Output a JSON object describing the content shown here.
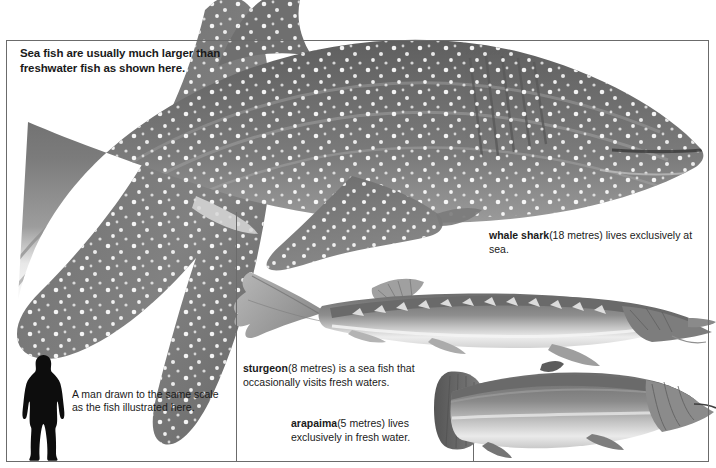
{
  "figure": {
    "headline": "Sea fish are usually much larger than freshwater fish as shown here.",
    "background_color": "#ffffff",
    "frame_color": "#6b6b6b",
    "text_color": "#1a1a1a"
  },
  "captions": {
    "whale_shark": {
      "name": "whale shark",
      "size": "(18 metres)",
      "rest": " lives exclusively at sea."
    },
    "sturgeon": {
      "name": "sturgeon",
      "size": "(8 metres)",
      "rest": " is a sea fish that occasionally visits fresh waters."
    },
    "arapaima": {
      "name": "arapaima",
      "size": "(5 metres)",
      "rest": " lives exclusively in fresh water."
    },
    "man": {
      "text": "A man drawn to the same scale as the fish illustrated here."
    }
  },
  "specimens": [
    {
      "id": "whale-shark",
      "label": "whale shark",
      "length_metres": 18,
      "habitat": "sea"
    },
    {
      "id": "sturgeon",
      "label": "sturgeon",
      "length_metres": 8,
      "habitat": "sea and fresh water"
    },
    {
      "id": "arapaima",
      "label": "arapaima",
      "length_metres": 5,
      "habitat": "fresh water"
    },
    {
      "id": "man",
      "label": "man",
      "length_metres": 1.8,
      "habitat": "land"
    }
  ],
  "colors": {
    "body_dark": "#6e6e6e",
    "body_mid": "#8d8d8d",
    "body_light": "#c9c9c9",
    "belly": "#f2f2f2",
    "silhouette": "#0d0d0d",
    "sturgeon_body": "#9a9a9a",
    "arapaima_body": "#7a7a7a"
  }
}
